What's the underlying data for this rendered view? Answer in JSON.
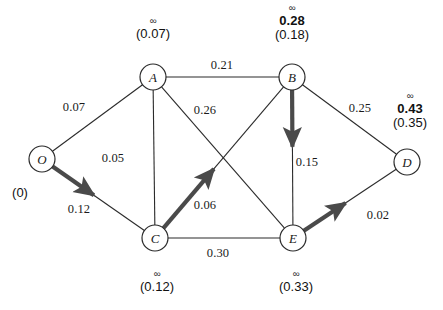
{
  "figure": {
    "type": "network-diagram",
    "background_color": "#ffffff",
    "line_color": "#2b2b2b",
    "highlight_color": "#4a4a4a",
    "node_fill": "#ffffff"
  },
  "nodes": [
    {
      "id": "O",
      "label": "O",
      "cx": 42,
      "cy": 159,
      "r": 13
    },
    {
      "id": "A",
      "label": "A",
      "cx": 153,
      "cy": 77,
      "r": 13
    },
    {
      "id": "B",
      "label": "B",
      "cx": 292,
      "cy": 77,
      "r": 13
    },
    {
      "id": "C",
      "label": "C",
      "cx": 155,
      "cy": 238,
      "r": 13
    },
    {
      "id": "D",
      "label": "D",
      "cx": 407,
      "cy": 162,
      "r": 13
    },
    {
      "id": "E",
      "label": "E",
      "cx": 293,
      "cy": 238,
      "r": 13
    }
  ],
  "edges": [
    {
      "from": "O",
      "to": "A",
      "weight": "0.07",
      "label_x": 74,
      "label_y": 107,
      "highlighted": false
    },
    {
      "from": "O",
      "to": "C",
      "weight": "0.12",
      "label_x": 79,
      "label_y": 209,
      "highlighted": true
    },
    {
      "from": "A",
      "to": "C",
      "weight": "0.05",
      "label_x": 113,
      "label_y": 158,
      "highlighted": false
    },
    {
      "from": "A",
      "to": "B",
      "weight": "0.21",
      "label_x": 222,
      "label_y": 65,
      "highlighted": false
    },
    {
      "from": "A",
      "to": "E",
      "weight": "0.26",
      "label_x": 205,
      "label_y": 110,
      "highlighted": false
    },
    {
      "from": "C",
      "to": "B",
      "weight": "0.06",
      "label_x": 205,
      "label_y": 205,
      "highlighted": true
    },
    {
      "from": "C",
      "to": "E",
      "weight": "0.30",
      "label_x": 218,
      "label_y": 253,
      "highlighted": false
    },
    {
      "from": "B",
      "to": "E",
      "weight": "0.15",
      "label_x": 307,
      "label_y": 162,
      "highlighted": true
    },
    {
      "from": "B",
      "to": "D",
      "weight": "0.25",
      "label_x": 360,
      "label_y": 108,
      "highlighted": false
    },
    {
      "from": "E",
      "to": "D",
      "weight": "0.02",
      "label_x": 378,
      "label_y": 215,
      "highlighted": true
    }
  ],
  "distance_labels": [
    {
      "node": "A",
      "infinity": "∞",
      "permanent": "",
      "temporary": "(0.07)",
      "x": 153,
      "y": 16
    },
    {
      "node": "B",
      "infinity": "∞",
      "permanent": "0.28",
      "temporary": "(0.18)",
      "x": 292,
      "y": 3
    },
    {
      "node": "D",
      "infinity": "∞",
      "permanent": "0.43",
      "temporary": "(0.35)",
      "x": 410,
      "y": 91
    },
    {
      "node": "C",
      "infinity": "∞",
      "permanent": "",
      "temporary": "(0.12)",
      "x": 157,
      "y": 269
    },
    {
      "node": "E",
      "infinity": "∞",
      "permanent": "",
      "temporary": "(0.33)",
      "x": 296,
      "y": 269
    }
  ],
  "origin_label": {
    "node": "O",
    "text": "(0)",
    "x": 20,
    "y": 192
  }
}
